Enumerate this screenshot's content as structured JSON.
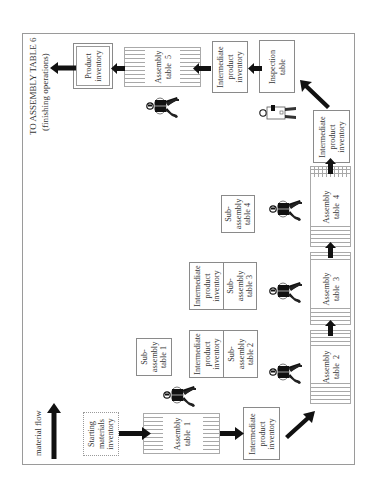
{
  "diagram": {
    "orientation": "rotated -90deg (text reads bottom-to-top)",
    "title_line1": "TO ASSEMBLY TABLE 6",
    "title_line2": "(finishing operations)",
    "legend": {
      "label": "material flow",
      "icon": "up-arrow-icon"
    },
    "nodes": {
      "starting_inventory": "Starting\nmaterials\ninventory",
      "assembly_1": "Assembly\ntable  1",
      "intermediate_1": "Intermediate\nproduct\ninventory",
      "subassembly_1": "Sub-\nassembly\ntable 1",
      "assembly_2": "Assembly\ntable  2",
      "intermediate_2": "Intermediate\nproduct\ninventory",
      "subassembly_2": "Sub-\nassembly\ntable 2",
      "assembly_3": "Assembly\ntable  3",
      "intermediate_3": "Intermediate\nproduct\ninventory",
      "subassembly_3": "Sub-\nassembly\ntable 3",
      "assembly_4": "Assembly\ntable  4",
      "subassembly_4": "Sub-\nassembly\ntable 4",
      "intermediate_4": "Intermediate\nproduct\ninventory",
      "inspection": "Inspection\ntable",
      "intermediate_5": "Intermediate\nproduct\ninventory",
      "assembly_5": "Assembly\ntable  5",
      "product_inventory": "Product\ninventory"
    },
    "flow": [
      "Starting materials inventory",
      "Assembly table 1",
      "Intermediate product inventory",
      "Assembly table 2",
      "Assembly table 3",
      "Assembly table 4",
      "Intermediate product inventory",
      "Inspection table",
      "Intermediate product inventory",
      "Assembly table 5",
      "Product inventory",
      "TO ASSEMBLY TABLE 6"
    ],
    "workers": 5,
    "inspectors": 1,
    "colors": {
      "line": "#8a8a8a",
      "arrow": "#111111",
      "text": "#333333"
    }
  }
}
